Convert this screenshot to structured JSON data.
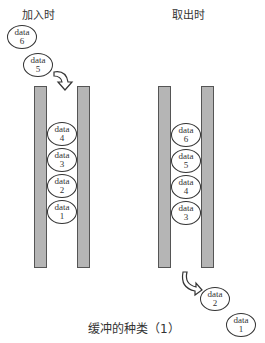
{
  "diagram": {
    "left_panel": {
      "title": "加入时",
      "outside": [
        {
          "text": "data",
          "num": "6"
        },
        {
          "text": "data",
          "num": "5"
        }
      ],
      "inside": [
        {
          "text": "data",
          "num": "4"
        },
        {
          "text": "data",
          "num": "3"
        },
        {
          "text": "data",
          "num": "2"
        },
        {
          "text": "data",
          "num": "1"
        }
      ]
    },
    "right_panel": {
      "title": "取出时",
      "inside": [
        {
          "text": "data",
          "num": "6"
        },
        {
          "text": "data",
          "num": "5"
        },
        {
          "text": "data",
          "num": "4"
        },
        {
          "text": "data",
          "num": "3"
        }
      ],
      "outside": [
        {
          "text": "data",
          "num": "2"
        },
        {
          "text": "data",
          "num": "1"
        }
      ]
    },
    "caption": "缓冲的种类（1）",
    "colors": {
      "tube_fill": "#b5b5b5",
      "tube_border": "#555555",
      "ball_border": "#333333"
    }
  }
}
